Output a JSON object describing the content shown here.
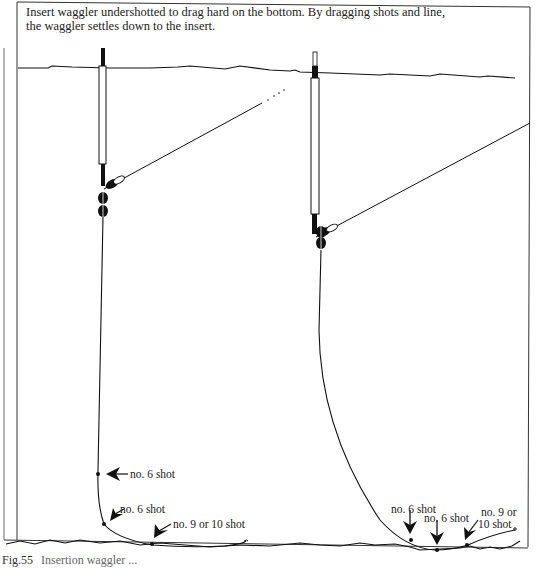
{
  "header": {
    "line1": "Insert waggler undershotted to drag hard on the bottom. By dragging shots and line,",
    "line2": "the waggler settles down to the insert."
  },
  "left_rig": {
    "labels": {
      "shot_upper": "no. 6 shot",
      "shot_lower": "no. 6 shot",
      "shot_bottom": "no. 9 or 10 shot"
    }
  },
  "right_rig": {
    "labels": {
      "shot_a": "no. 6 shot",
      "shot_b": "no. 6 shot",
      "shot_c_line1": "no. 9 or",
      "shot_c_line2": "10 shot"
    }
  },
  "figure": {
    "number": "Fig.55",
    "caption_partial": "Insertion waggler ..."
  },
  "colors": {
    "ink": "#111111",
    "background": "#ffffff",
    "border": "#333333"
  }
}
